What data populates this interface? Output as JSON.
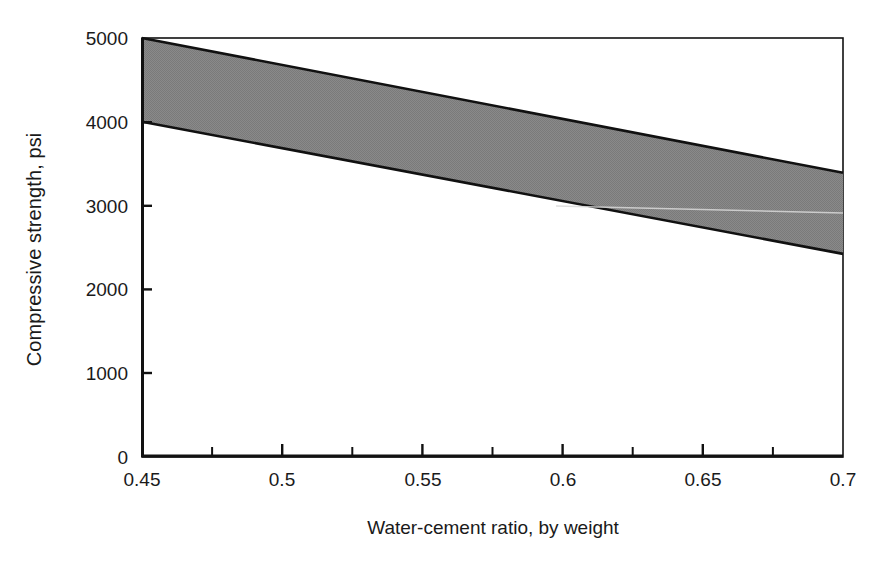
{
  "chart_data": {
    "type": "area",
    "title": "",
    "subtitle": "",
    "xlabel": "Water-cement ratio, by weight",
    "ylabel": "Compressive strength, psi",
    "xlim": [
      0.45,
      0.7
    ],
    "ylim": [
      0,
      5000
    ],
    "grid": false,
    "legend": null,
    "x_ticks": [
      0.45,
      0.5,
      0.55,
      0.6,
      0.65,
      0.7
    ],
    "x_tick_labels": [
      "0.45",
      "0.5",
      "0.55",
      "0.6",
      "0.65",
      "0.7"
    ],
    "x_minor_ticks": [
      0.475,
      0.525,
      0.575,
      0.625,
      0.675
    ],
    "y_ticks": [
      0,
      1000,
      2000,
      3000,
      4000,
      5000
    ],
    "y_tick_labels": [
      "0",
      "1000",
      "2000",
      "3000",
      "4000",
      "5000"
    ],
    "band_fill_color": "#808080",
    "band_edge_color": "#000000",
    "axis_color": "#000000",
    "background_color": "#ffffff",
    "series": [
      {
        "name": "Upper bound",
        "x": [
          0.45,
          0.7
        ],
        "values": [
          5000,
          3390
        ]
      },
      {
        "name": "Lower bound",
        "x": [
          0.45,
          0.7
        ],
        "values": [
          4000,
          2420
        ]
      }
    ],
    "annotations": []
  }
}
